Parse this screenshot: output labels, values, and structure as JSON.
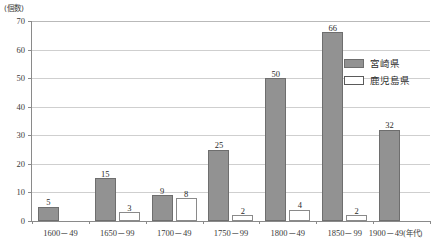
{
  "chart_data": {
    "type": "bar",
    "title": "",
    "subtitle": "",
    "xlabel": "年代",
    "ylabel": "個数",
    "y_unit_caption": "(個数)",
    "x_unit_caption": "(年代)",
    "categories": [
      "1600－49",
      "1650－99",
      "1700－49",
      "1750－99",
      "1800－49",
      "1850－99",
      "1900－49"
    ],
    "series": [
      {
        "name": "宮崎県",
        "values": [
          5,
          15,
          9,
          25,
          50,
          66,
          32
        ],
        "color": "#929292",
        "style": "filled"
      },
      {
        "name": "鹿児島県",
        "values": [
          0,
          3,
          8,
          2,
          4,
          2,
          0
        ],
        "color": "#ffffff",
        "style": "outlined"
      }
    ],
    "ylim": [
      0,
      70
    ],
    "yticks": [
      0,
      10,
      20,
      30,
      40,
      50,
      60,
      70
    ],
    "ytick_labels": [
      "0",
      "10",
      "20",
      "30",
      "40",
      "50",
      "60",
      "70"
    ],
    "grid": true,
    "grid_axis": "y",
    "legend_position": "right-upper",
    "show_value_labels": true
  },
  "legend": {
    "items": [
      {
        "label": "宮崎県",
        "swatch": "filled-gray"
      },
      {
        "label": "鹿児島県",
        "swatch": "hollow-white"
      }
    ]
  },
  "colors": {
    "bar_fill": "#929292",
    "bar_border": "#6e6e6e",
    "bar_hollow_fill": "#ffffff",
    "bar_hollow_border": "#8a8a8a",
    "axis": "#8a8a8a",
    "gridline": "#cfcfcf",
    "text": "#2b2b2b"
  }
}
